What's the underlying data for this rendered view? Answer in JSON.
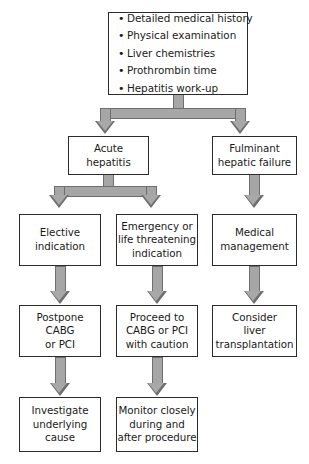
{
  "diagram": {
    "colors": {
      "box_border": "#2b2b2b",
      "box_fill": "#ffffff",
      "arrow_fill": "#a6a6a6",
      "arrow_border": "#6e6e6e",
      "text": "#1a1a1a",
      "background": "#ffffff"
    },
    "nodes": {
      "workup": {
        "name": "initial-workup",
        "bullets": [
          "Detailed medical history",
          "Physical examination",
          "Liver chemistries",
          "Prothrombin time",
          "Hepatitis work-up"
        ]
      },
      "acute_hepatitis": {
        "name": "acute-hepatitis",
        "lines": [
          "Acute",
          "hepatitis"
        ]
      },
      "fulminant_failure": {
        "name": "fulminant-hepatic-failure",
        "lines": [
          "Fulminant",
          "hepatic failure"
        ]
      },
      "elective": {
        "name": "elective-indication",
        "lines": [
          "Elective",
          "indication"
        ]
      },
      "emergency": {
        "name": "emergency-indication",
        "lines": [
          "Emergency or",
          "life threatening",
          "indication"
        ]
      },
      "medical_mgmt": {
        "name": "medical-management",
        "lines": [
          "Medical",
          "management"
        ]
      },
      "postpone": {
        "name": "postpone-cabg-pci",
        "lines": [
          "Postpone",
          "CABG",
          "or PCI"
        ]
      },
      "proceed": {
        "name": "proceed-cabg-pci",
        "lines": [
          "Proceed to",
          "CABG or PCI",
          "with caution"
        ]
      },
      "transplant": {
        "name": "consider-liver-transplantation",
        "lines": [
          "Consider",
          "liver",
          "transplantation"
        ]
      },
      "investigate": {
        "name": "investigate-underlying-cause",
        "lines": [
          "Investigate",
          "underlying",
          "cause"
        ]
      },
      "monitor": {
        "name": "monitor-closely",
        "lines": [
          "Monitor closely",
          "during and",
          "after procedure"
        ]
      }
    }
  }
}
